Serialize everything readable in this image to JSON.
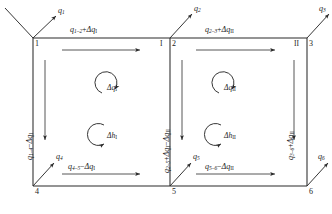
{
  "diagram": {
    "type": "pipe-network-loop-diagram",
    "nodes": [
      {
        "id": "n1",
        "label": "1"
      },
      {
        "id": "n2",
        "label": "2"
      },
      {
        "id": "n3",
        "label": "3"
      },
      {
        "id": "n4",
        "label": "4"
      },
      {
        "id": "n5",
        "label": "5"
      },
      {
        "id": "n6",
        "label": "6"
      }
    ],
    "loops": [
      {
        "id": "loop1",
        "label": "I"
      },
      {
        "id": "loop2",
        "label": "II"
      }
    ],
    "external_flows": [
      {
        "id": "q1",
        "base": "q",
        "sub": "1"
      },
      {
        "id": "q2",
        "base": "q",
        "sub": "2"
      },
      {
        "id": "q3",
        "base": "q",
        "sub": "3"
      },
      {
        "id": "q4",
        "base": "q",
        "sub": "4"
      },
      {
        "id": "q5",
        "base": "q",
        "sub": "5"
      },
      {
        "id": "q6",
        "base": "q",
        "sub": "6"
      }
    ],
    "edges": [
      {
        "id": "e12",
        "base": "q",
        "sub": "1–2",
        "op": "+",
        "delta_base": "Δq",
        "delta_sub": "I",
        "orientation": "horizontal",
        "arrow": "right"
      },
      {
        "id": "e23",
        "base": "q",
        "sub": "2–3",
        "op": "+",
        "delta_base": "Δq",
        "delta_sub": "II",
        "orientation": "horizontal",
        "arrow": "right"
      },
      {
        "id": "e14",
        "base": "q",
        "sub": "1–4",
        "op": "−",
        "delta_base": "Δq",
        "delta_sub": "I",
        "orientation": "vertical",
        "arrow": "down"
      },
      {
        "id": "e25",
        "base": "q",
        "sub": "2–5",
        "op": "+",
        "delta_base": "Δq",
        "delta_sub": "I",
        "op2": "−",
        "delta2_base": "Δq",
        "delta2_sub": "II",
        "orientation": "vertical",
        "arrow": "down"
      },
      {
        "id": "e36",
        "base": "q",
        "sub": "3–6",
        "op": "+",
        "delta_base": "Δq",
        "delta_sub": "II",
        "orientation": "vertical",
        "arrow": "down"
      },
      {
        "id": "e45",
        "base": "q",
        "sub": "4–5",
        "op": "−",
        "delta_base": "Δq",
        "delta_sub": "I",
        "orientation": "horizontal",
        "arrow": "right"
      },
      {
        "id": "e56",
        "base": "q",
        "sub": "5–6",
        "op": "−",
        "delta_base": "Δq",
        "delta_sub": "II",
        "orientation": "horizontal",
        "arrow": "right"
      }
    ],
    "corrections": [
      {
        "id": "dq1",
        "base": "Δq",
        "sub": "I",
        "loop": "I",
        "kind": "flow"
      },
      {
        "id": "dh1",
        "base": "Δh",
        "sub": "I",
        "loop": "I",
        "kind": "head"
      },
      {
        "id": "dq2",
        "base": "Δq",
        "sub": "II",
        "loop": "II",
        "kind": "flow"
      },
      {
        "id": "dh2",
        "base": "Δh",
        "sub": "II",
        "loop": "II",
        "kind": "head"
      }
    ]
  },
  "colors": {
    "line": "#2b2b2b",
    "text": "#1a1a1a",
    "background": "#ffffff"
  }
}
